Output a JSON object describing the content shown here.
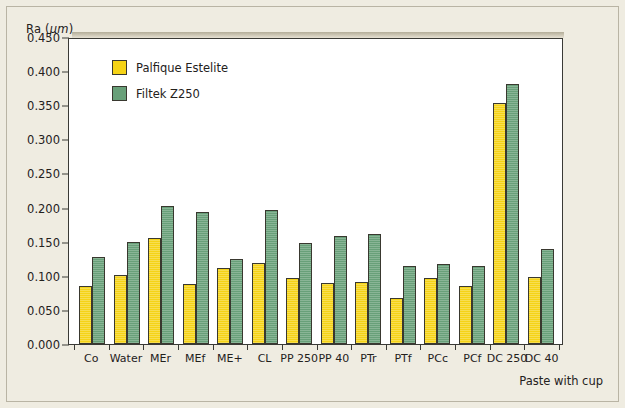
{
  "chart_data": {
    "type": "bar",
    "title": "",
    "ylabel": "Ra (μm)",
    "xlabel": "Paste with cup",
    "ylim": [
      0.0,
      0.45
    ],
    "ytick_labels": [
      "0.450",
      "0.400",
      "0.350",
      "0.300",
      "0.250",
      "0.200",
      "0.150",
      "0.100",
      "0.050",
      "0.000"
    ],
    "ytick_values": [
      0.45,
      0.4,
      0.35,
      0.3,
      0.25,
      0.2,
      0.15,
      0.1,
      0.05,
      0.0
    ],
    "grid": false,
    "legend_position": "upper-left-inside",
    "categories": [
      "Co",
      "Water",
      "MEr",
      "MEf",
      "ME+",
      "CL",
      "PP 250",
      "PP 40",
      "PTr",
      "PTf",
      "PCc",
      "PCf",
      "DC 250",
      "DC 40"
    ],
    "series": [
      {
        "name": "Palfique Estelite",
        "color": "#f5d316",
        "values": [
          0.085,
          0.101,
          0.155,
          0.088,
          0.111,
          0.119,
          0.097,
          0.09,
          0.091,
          0.068,
          0.097,
          0.085,
          0.354,
          0.098
        ]
      },
      {
        "name": "Filtek Z250",
        "color": "#68a079",
        "values": [
          0.128,
          0.15,
          0.202,
          0.194,
          0.124,
          0.197,
          0.148,
          0.158,
          0.161,
          0.115,
          0.117,
          0.114,
          0.381,
          0.14
        ]
      }
    ]
  }
}
